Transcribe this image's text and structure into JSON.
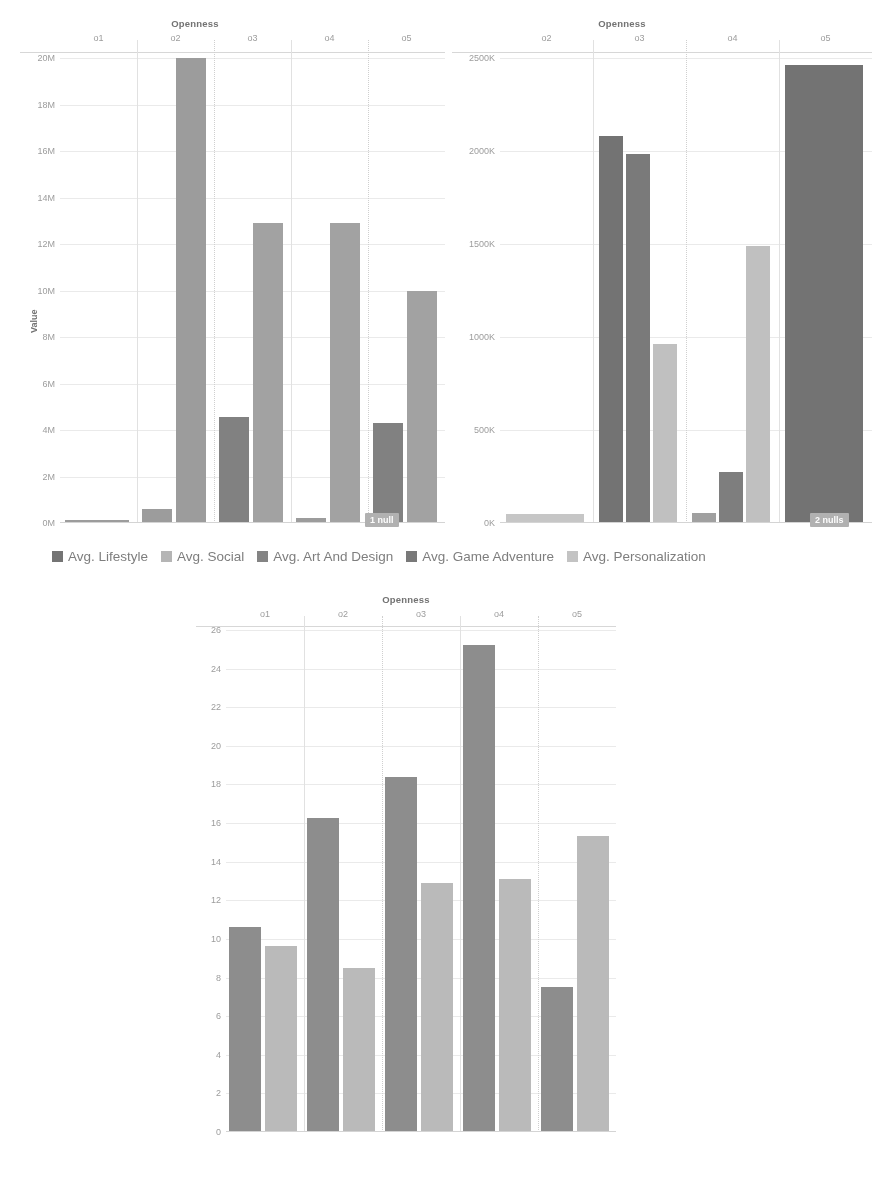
{
  "legend": {
    "items": [
      {
        "label": "Avg. Lifestyle",
        "color": "#6f6f6f"
      },
      {
        "label": "Avg. Social",
        "color": "#b4b4b4"
      },
      {
        "label": "Avg. Art And Design",
        "color": "#808080"
      },
      {
        "label": "Avg. Game Adventure",
        "color": "#757575"
      },
      {
        "label": "Avg. Personalization",
        "color": "#c3c3c3"
      }
    ]
  },
  "chart_data": [
    {
      "id": "chart-top-left",
      "type": "bar",
      "title": "Openness",
      "xlabel": "Openness",
      "ylabel": "Value",
      "categories": [
        "o1",
        "o2",
        "o3",
        "o4",
        "o5"
      ],
      "yticks": [
        "20M",
        "18M",
        "16M",
        "14M",
        "12M",
        "10M",
        "8M",
        "6M",
        "4M",
        "2M",
        "0M"
      ],
      "ylim": [
        0,
        20000000
      ],
      "grid": true,
      "legend_position": "bottom",
      "annotation": "1 null",
      "series": [
        {
          "name": "Avg. Lifestyle",
          "color": "#6f6f6f",
          "values": [
            null,
            null,
            null,
            null,
            4300000
          ]
        },
        {
          "name": "Avg. Social",
          "color": "#b4b4b4",
          "values": [
            null,
            null,
            null,
            12900000,
            10000000
          ]
        },
        {
          "name": "Avg. Art And Design",
          "color": "#808080",
          "values": [
            120000,
            20000000,
            null,
            null,
            null
          ]
        },
        {
          "name": "Avg. Game Adventure",
          "color": "#757575",
          "values": [
            null,
            null,
            4550000,
            null,
            null
          ]
        },
        {
          "name": "Avg. Personalization",
          "color": "#c3c3c3",
          "values": [
            null,
            600000,
            12900000,
            200000,
            null
          ]
        }
      ],
      "bars": [
        {
          "group": "o1",
          "series": "Avg. Art And Design",
          "value": 120000,
          "color": "#9a9a9a"
        },
        {
          "group": "o2",
          "series": "Avg. Personalization",
          "value": 620000,
          "color": "#9a9a9a"
        },
        {
          "group": "o2",
          "series": "Avg. Art And Design",
          "value": 20000000,
          "color": "#9a9a9a"
        },
        {
          "group": "o3",
          "series": "Avg. Game Adventure",
          "value": 4550000,
          "color": "#7d7d7d"
        },
        {
          "group": "o3",
          "series": "Avg. Personalization",
          "value": 12900000,
          "color": "#a0a0a0"
        },
        {
          "group": "o4",
          "series": "Avg. Lifestyle",
          "value": 210000,
          "color": "#9a9a9a"
        },
        {
          "group": "o4",
          "series": "Avg. Social",
          "value": 12900000,
          "color": "#a0a0a0"
        },
        {
          "group": "o5",
          "series": "Avg. Lifestyle",
          "value": 4300000,
          "color": "#7d7d7d"
        },
        {
          "group": "o5",
          "series": "Avg. Social",
          "value": 10000000,
          "color": "#a0a0a0"
        }
      ]
    },
    {
      "id": "chart-top-right",
      "type": "bar",
      "title": "Openness",
      "xlabel": "Openness",
      "ylabel": "",
      "categories": [
        "o2",
        "o3",
        "o4",
        "o5"
      ],
      "yticks": [
        "2500K",
        "2000K",
        "1500K",
        "1000K",
        "500K",
        "0K"
      ],
      "ylim": [
        0,
        2750000
      ],
      "grid": true,
      "legend_position": "bottom",
      "annotation": "2 nulls",
      "bars": [
        {
          "group": "o2",
          "series": "Avg. Personalization",
          "value": 55000,
          "color": "#c6c6c6"
        },
        {
          "group": "o3",
          "series": "Avg. Game Adventure",
          "value": 2290000,
          "color": "#6e6e6e"
        },
        {
          "group": "o3",
          "series": "Avg. Lifestyle",
          "value": 2180000,
          "color": "#767676"
        },
        {
          "group": "o3",
          "series": "Avg. Personalization",
          "value": 1060000,
          "color": "#c0c0c0"
        },
        {
          "group": "o4",
          "series": "Avg. Social",
          "value": 60000,
          "color": "#9e9e9e"
        },
        {
          "group": "o4",
          "series": "Avg. Art And Design",
          "value": 300000,
          "color": "#7a7a7a"
        },
        {
          "group": "o4",
          "series": "Avg. Personalization",
          "value": 1640000,
          "color": "#c0c0c0"
        },
        {
          "group": "o5",
          "series": "Avg. Game Adventure",
          "value": 2710000,
          "color": "#6e6e6e"
        }
      ]
    },
    {
      "id": "chart-bottom",
      "type": "bar",
      "title": "Openness",
      "xlabel": "Openness",
      "ylabel": "",
      "categories": [
        "o1",
        "o2",
        "o3",
        "o4",
        "o5"
      ],
      "yticks": [
        "26",
        "24",
        "22",
        "20",
        "18",
        "16",
        "14",
        "12",
        "10",
        "8",
        "6",
        "4",
        "2",
        "0"
      ],
      "ylim": [
        0,
        27
      ],
      "grid": true,
      "legend_position": "none",
      "series": [
        {
          "name": "dark",
          "color": "#8a8a8a",
          "values": [
            11.0,
            16.9,
            19.1,
            26.2,
            7.8
          ]
        },
        {
          "name": "light",
          "color": "#b9b9b9",
          "values": [
            10.0,
            8.8,
            13.4,
            13.6,
            15.9
          ]
        }
      ],
      "bars": [
        {
          "group": "o1",
          "series": "dark",
          "value": 11.0,
          "color": "#8a8a8a"
        },
        {
          "group": "o1",
          "series": "light",
          "value": 10.0,
          "color": "#b9b9b9"
        },
        {
          "group": "o2",
          "series": "dark",
          "value": 16.9,
          "color": "#8a8a8a"
        },
        {
          "group": "o2",
          "series": "light",
          "value": 8.8,
          "color": "#b9b9b9"
        },
        {
          "group": "o3",
          "series": "dark",
          "value": 19.1,
          "color": "#8a8a8a"
        },
        {
          "group": "o3",
          "series": "light",
          "value": 13.4,
          "color": "#b9b9b9"
        },
        {
          "group": "o4",
          "series": "dark",
          "value": 26.2,
          "color": "#8a8a8a"
        },
        {
          "group": "o4",
          "series": "light",
          "value": 13.6,
          "color": "#b9b9b9"
        },
        {
          "group": "o5",
          "series": "dark",
          "value": 7.8,
          "color": "#8a8a8a"
        },
        {
          "group": "o5",
          "series": "light",
          "value": 15.9,
          "color": "#b9b9b9"
        }
      ]
    }
  ]
}
